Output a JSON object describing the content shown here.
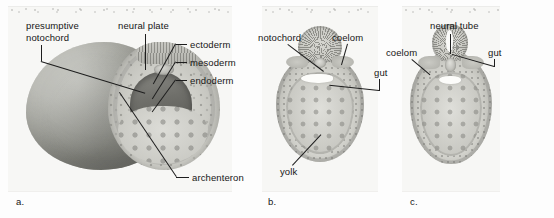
{
  "figure": {
    "background_color": "#fdfdfd",
    "panel_color": "#f7f7f5",
    "label_color": "#161616",
    "leader_color": "#1d1d1d"
  },
  "panels": [
    {
      "id": "a",
      "caption": "a.",
      "view": "three-quarter cutaway of gastrula",
      "labels": [
        {
          "key": "presumptive-notochord",
          "text": "presumptive\nnotochord",
          "line1": "presumptive",
          "line2": "notochord"
        },
        {
          "key": "neural-plate",
          "text": "neural plate"
        },
        {
          "key": "ectoderm",
          "text": "ectoderm"
        },
        {
          "key": "mesoderm",
          "text": "mesoderm"
        },
        {
          "key": "endoderm",
          "text": "endoderm"
        },
        {
          "key": "archenteron",
          "text": "archenteron"
        }
      ]
    },
    {
      "id": "b",
      "caption": "b.",
      "view": "cross section, neural groove stage",
      "labels": [
        {
          "key": "notochord",
          "text": "notochord"
        },
        {
          "key": "coelom",
          "text": "coelom"
        },
        {
          "key": "gut",
          "text": "gut"
        },
        {
          "key": "yolk",
          "text": "yolk"
        }
      ]
    },
    {
      "id": "c",
      "caption": "c.",
      "view": "cross section, closed neural tube stage",
      "labels": [
        {
          "key": "neural-tube",
          "text": "neural tube"
        },
        {
          "key": "coelom",
          "text": "coelom"
        },
        {
          "key": "gut",
          "text": "gut"
        }
      ]
    }
  ]
}
